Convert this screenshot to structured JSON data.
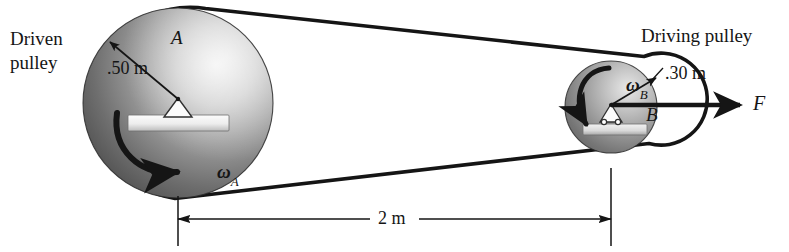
{
  "figure": {
    "background_color": "#ffffff",
    "ink_color": "#151515"
  },
  "labels": {
    "driven_pulley_line1": "Driven",
    "driven_pulley_line2": "pulley",
    "driving_pulley": "Driving pulley",
    "pulley_a_name": "A",
    "pulley_b_name": "B",
    "radius_a": ".50 m",
    "radius_b": ".30 m",
    "omega_a_symbol": "ω",
    "omega_a_subscript": "A",
    "omega_b_symbol": "ω",
    "omega_b_subscript": "B",
    "force_label": "F",
    "span_dimension": "2 m"
  },
  "geometry": {
    "pulley_a": {
      "cx": 178,
      "cy": 103,
      "r": 95,
      "radius_value": 0.5,
      "units": "m"
    },
    "pulley_b": {
      "cx": 611,
      "cy": 107,
      "r": 46,
      "radius_value": 0.3,
      "units": "m"
    },
    "center_distance_value": 2,
    "center_distance_units": "m",
    "belt_top_start": [
      205,
      8
    ],
    "belt_top_end": [
      645,
      55
    ],
    "belt_bottom_start": [
      174,
      198
    ],
    "belt_bottom_end": [
      650,
      143
    ],
    "dimension_line_y": 219,
    "extension_left_x": 178,
    "extension_right_x": 611
  },
  "colors": {
    "ink": "#151515",
    "pulley_dark": "#3a3a3a",
    "pulley_mid": "#8e8e8e",
    "pulley_light": "#f0f0f0",
    "hub_white": "#f5f5f5",
    "base_gray": "#d8d8d8"
  }
}
